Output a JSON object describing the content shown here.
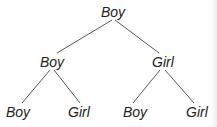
{
  "diagram": {
    "type": "binary-tree",
    "title": "",
    "background_color": "#fefefe",
    "line_color": "#53565a",
    "text_color": "#231f20",
    "levels": 3,
    "nodes": [
      {
        "id": "root",
        "label": "Boy",
        "level": 0,
        "x": 113,
        "y": 12
      },
      {
        "id": "l1",
        "label": "Boy",
        "level": 1,
        "x": 52,
        "y": 62
      },
      {
        "id": "r1",
        "label": "Girl",
        "level": 1,
        "x": 163,
        "y": 62
      },
      {
        "id": "ll2",
        "label": "Boy",
        "level": 2,
        "x": 18,
        "y": 112
      },
      {
        "id": "lr2",
        "label": "Girl",
        "level": 2,
        "x": 79,
        "y": 112
      },
      {
        "id": "rl2",
        "label": "Boy",
        "level": 2,
        "x": 135,
        "y": 112
      },
      {
        "id": "rr2",
        "label": "Girl",
        "level": 2,
        "x": 197,
        "y": 112
      }
    ],
    "edges": [
      {
        "from": "root",
        "to": "l1",
        "x1": 112,
        "y1": 20,
        "x2": 57,
        "y2": 53
      },
      {
        "from": "root",
        "to": "r1",
        "x1": 115,
        "y1": 20,
        "x2": 159,
        "y2": 53
      },
      {
        "from": "l1",
        "to": "ll2",
        "x1": 50,
        "y1": 70,
        "x2": 22,
        "y2": 103
      },
      {
        "from": "l1",
        "to": "lr2",
        "x1": 54,
        "y1": 70,
        "x2": 80,
        "y2": 103
      },
      {
        "from": "r1",
        "to": "rl2",
        "x1": 160,
        "y1": 70,
        "x2": 133,
        "y2": 103
      },
      {
        "from": "r1",
        "to": "rr2",
        "x1": 165,
        "y1": 70,
        "x2": 194,
        "y2": 103
      }
    ]
  }
}
